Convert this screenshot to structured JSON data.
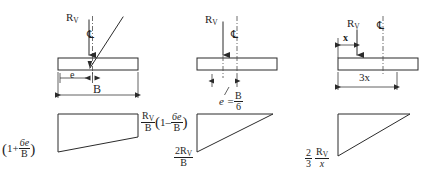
{
  "figure": {
    "background_color": "#ffffff",
    "line_color": "#2b2b2b",
    "text_color": "#1f1f1f"
  },
  "symbols": {
    "resultant": "R",
    "resultant_sub": "V",
    "centerline": "℄",
    "eccentricity": "e",
    "width": "B",
    "x": "x"
  },
  "cases": [
    {
      "id": "case-small-eccentricity",
      "name": "e less than B/6",
      "load_label": {
        "base": "R",
        "sub": "V"
      },
      "centerline_label": "℄",
      "dimensions": [
        {
          "name": "eccentricity",
          "label": "e"
        },
        {
          "name": "footing-width",
          "label": "B"
        }
      ],
      "pressure_shape": "trapezoid",
      "pressure_labels": [
        {
          "name": "max-pressure",
          "position": "left",
          "parts": {
            "lead": "",
            "paren_open": "(",
            "one": "1+",
            "frac_num": "6e",
            "frac_den": "B",
            "paren_close": ")"
          },
          "plain": "(1 + 6e/B)"
        },
        {
          "name": "min-pressure",
          "position": "right",
          "parts": {
            "base": "R",
            "sub": "V",
            "over": "B",
            "paren_open": "(",
            "one": "1–",
            "frac_num": "6e",
            "frac_den": "B",
            "paren_close": ")"
          },
          "plain": "R_V/B (1 - 6e/B)"
        }
      ]
    },
    {
      "id": "case-middle-third-limit",
      "name": "e equals B/6",
      "load_label": {
        "base": "R",
        "sub": "V"
      },
      "centerline_label": "℄",
      "dimensions": [
        {
          "name": "eccentricity-equals",
          "label_lead": "e =",
          "frac_num": "B",
          "frac_den": "6",
          "plain": "e = B/6"
        }
      ],
      "pressure_shape": "triangle",
      "pressure_labels": [
        {
          "name": "max-pressure",
          "position": "left",
          "parts": {
            "num_lead": "2R",
            "num_sub": "V",
            "den": "B"
          },
          "plain": "2R_V/B"
        }
      ]
    },
    {
      "id": "case-outside-middle-third",
      "name": "e greater than B/6",
      "load_label": {
        "base": "R",
        "sub": "V"
      },
      "centerline_label": "℄",
      "dimensions": [
        {
          "name": "edge-distance",
          "label": "x"
        },
        {
          "name": "bearing-length",
          "label": "3x"
        }
      ],
      "pressure_shape": "triangle",
      "pressure_labels": [
        {
          "name": "max-pressure",
          "position": "left",
          "parts": {
            "f1_num": "2",
            "f1_den": "3",
            "f2_num_lead": "R",
            "f2_num_sub": "V",
            "f2_den": "x"
          },
          "plain": "2/3 R_V/x"
        }
      ]
    }
  ]
}
